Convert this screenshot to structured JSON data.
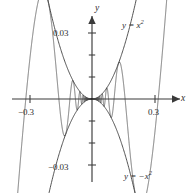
{
  "figure": {
    "name": "squeeze-theorem-plot",
    "background_color": "#ffffff",
    "line_color": "#3a3a3a",
    "curve_color": "#454545"
  },
  "axes": {
    "x_axis_label": "x",
    "y_axis_label": "y",
    "x_ticks": [
      {
        "value": -0.3,
        "label": "−0.3"
      },
      {
        "value": 0.3,
        "label": "0.3"
      }
    ],
    "y_ticks": [
      {
        "value": 0.03,
        "label": "0.03"
      },
      {
        "value": -0.03,
        "label": "−0.03"
      }
    ]
  },
  "curve_labels": {
    "upper_base": "y = x",
    "upper_exponent": "2",
    "lower_base": "y = −x",
    "lower_exponent": "2"
  },
  "chart_data": {
    "type": "line",
    "title": "",
    "xlabel": "x",
    "ylabel": "y",
    "xlim": [
      -0.38,
      0.38
    ],
    "ylim": [
      -0.046,
      0.046
    ],
    "grid": false,
    "legend": "inline-curve-labels",
    "xticks": [
      -0.3,
      0.3
    ],
    "xticklabels": [
      "−0.3",
      "0.3"
    ],
    "yticks": [
      -0.03,
      0.03
    ],
    "yticklabels": [
      "−0.03",
      "0.03"
    ],
    "minor_yticks": [
      -0.02,
      -0.01,
      0.01,
      0.02
    ],
    "series": [
      {
        "name": "y = x^2",
        "role": "upper-envelope",
        "formula": "x^2",
        "annotation": "y = x²"
      },
      {
        "name": "y = -x^2",
        "role": "lower-envelope",
        "formula": "-x^2",
        "annotation": "y = −x²"
      },
      {
        "name": "y = x^2 sin(1/x)",
        "role": "oscillating",
        "formula": "x^2*sin(1/x)",
        "annotation": ""
      }
    ]
  }
}
